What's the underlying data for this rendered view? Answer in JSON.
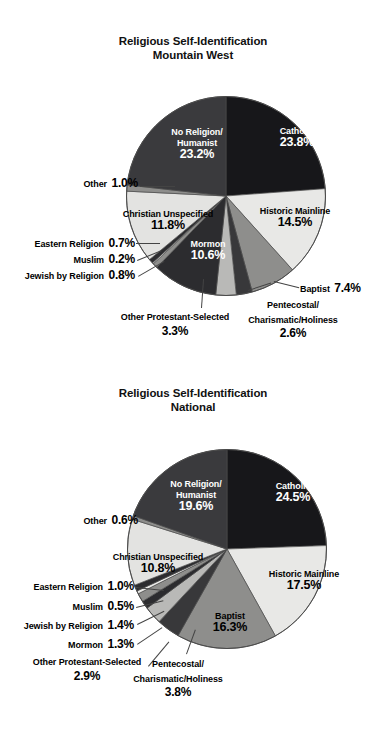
{
  "page": {
    "background": "#ffffff",
    "width": 386,
    "height": 732
  },
  "charts": [
    {
      "id": "mountain-west",
      "title_line1": "Religious Self-Identification",
      "title_line2": "Mountain West",
      "labels": {
        "catholic": {
          "name": "Catholic",
          "pct": "23.8%"
        },
        "historic_mainline": {
          "name": "Historic Mainline",
          "pct": "14.5%"
        },
        "baptist": {
          "name": "Baptist",
          "pct": "7.4%"
        },
        "pentecostal": {
          "name": "Pentecostal/",
          "name2": "Charismatic/Holiness",
          "pct": "2.6%"
        },
        "other_protestant": {
          "name": "Other Protestant-Selected",
          "pct": "3.3%"
        },
        "mormon": {
          "name": "Mormon",
          "pct": "10.6%"
        },
        "jewish": {
          "name": "Jewish by Religion",
          "pct": "0.8%"
        },
        "muslim": {
          "name": "Muslim",
          "pct": "0.2%"
        },
        "eastern": {
          "name": "Eastern Religion",
          "pct": "0.7%"
        },
        "christian_unspecified": {
          "name": "Christian Unspecified",
          "pct": "11.8%"
        },
        "other": {
          "name": "Other",
          "pct": "1.0%"
        },
        "no_religion": {
          "name": "No Religion/",
          "name2": "Humanist",
          "pct": "23.2%"
        }
      }
    },
    {
      "id": "national",
      "title_line1": "Religious Self-Identification",
      "title_line2": "National",
      "labels": {
        "catholic": {
          "name": "Catholic",
          "pct": "24.5%"
        },
        "historic_mainline": {
          "name": "Historic Mainline",
          "pct": "17.5%"
        },
        "baptist": {
          "name": "Baptist",
          "pct": "16.3%"
        },
        "pentecostal": {
          "name": "Pentecostal/",
          "name2": "Charismatic/Holiness",
          "pct": "3.8%"
        },
        "other_protestant": {
          "name": "Other Protestant-Selected",
          "pct": "2.9%"
        },
        "mormon": {
          "name": "Mormon",
          "pct": "1.3%"
        },
        "jewish": {
          "name": "Jewish by Religion",
          "pct": "1.4%"
        },
        "muslim": {
          "name": "Muslim",
          "pct": "0.5%"
        },
        "eastern": {
          "name": "Eastern Religion",
          "pct": "1.0%"
        },
        "christian_unspecified": {
          "name": "Christian Unspecified",
          "pct": "10.8%"
        },
        "other": {
          "name": "Other",
          "pct": "0.6%"
        },
        "no_religion": {
          "name": "No Religion/",
          "name2": "Humanist",
          "pct": "19.6%"
        }
      }
    }
  ],
  "chart_data": [
    {
      "type": "pie",
      "title": "Religious Self-Identification Mountain West",
      "start_angle_deg": 0,
      "direction": "clockwise",
      "unit": "percent",
      "categories": [
        "Catholic",
        "Historic Mainline",
        "Baptist",
        "Pentecostal/Charismatic/Holiness",
        "Other Protestant-Selected",
        "Mormon",
        "Jewish by Religion",
        "Muslim",
        "Eastern Religion",
        "Christian Unspecified",
        "Other",
        "No Religion/Humanist"
      ],
      "values": [
        23.8,
        14.5,
        7.4,
        2.6,
        3.3,
        10.6,
        0.8,
        0.2,
        0.7,
        11.8,
        1.0,
        23.2
      ],
      "colors": [
        "#17171a",
        "#e8e8e6",
        "#8e8e8c",
        "#38383a",
        "#b9b9b7",
        "#2c2c2f",
        "#8e8e8c",
        "#e8e8e6",
        "#2c2c2f",
        "#e3e3e1",
        "#8e8e8c",
        "#3a3a3d"
      ],
      "legend": "none",
      "labels_inside": [
        "Catholic",
        "Historic Mainline",
        "Mormon",
        "Christian Unspecified",
        "No Religion/Humanist"
      ],
      "labels_outside": [
        "Baptist",
        "Pentecostal/Charismatic/Holiness",
        "Other Protestant-Selected",
        "Jewish by Religion",
        "Muslim",
        "Eastern Religion",
        "Other"
      ]
    },
    {
      "type": "pie",
      "title": "Religious Self-Identification National",
      "start_angle_deg": 0,
      "direction": "clockwise",
      "unit": "percent",
      "categories": [
        "Catholic",
        "Historic Mainline",
        "Baptist",
        "Pentecostal/Charismatic/Holiness",
        "Other Protestant-Selected",
        "Mormon",
        "Jewish by Religion",
        "Muslim",
        "Eastern Religion",
        "Christian Unspecified",
        "Other",
        "No Religion/Humanist"
      ],
      "values": [
        24.5,
        17.5,
        16.3,
        3.8,
        2.9,
        1.3,
        1.4,
        0.5,
        1.0,
        10.8,
        0.6,
        19.6
      ],
      "colors": [
        "#17171a",
        "#e8e8e6",
        "#8e8e8c",
        "#38383a",
        "#b9b9b7",
        "#2c2c2f",
        "#8e8e8c",
        "#e8e8e6",
        "#2c2c2f",
        "#e3e3e1",
        "#8e8e8c",
        "#3a3a3d"
      ],
      "legend": "none",
      "labels_inside": [
        "Catholic",
        "Historic Mainline",
        "Baptist",
        "Christian Unspecified",
        "No Religion/Humanist"
      ],
      "labels_outside": [
        "Pentecostal/Charismatic/Holiness",
        "Other Protestant-Selected",
        "Mormon",
        "Jewish by Religion",
        "Muslim",
        "Eastern Religion",
        "Other"
      ]
    }
  ]
}
